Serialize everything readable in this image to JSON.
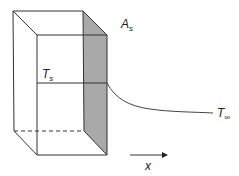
{
  "diagram": {
    "type": "heat-transfer-fin-schematic",
    "colors": {
      "line": "#333333",
      "shaded_face": "#a9a9a9",
      "background": "#ffffff"
    },
    "labels": {
      "surface_area": {
        "main": "A",
        "sub": "s"
      },
      "surface_temperature": {
        "main": "T",
        "sub": "s"
      },
      "ambient_temperature": {
        "main": "T",
        "sub": "∞"
      },
      "axis": {
        "main": "x"
      }
    },
    "elements": [
      "rectangular solid (wall/block) drawn in oblique projection",
      "shaded right face (surface area A_s)",
      "horizontal line at temperature T_s across front face",
      "temperature profile curve decaying from T_s to T_∞",
      "x-direction arrow"
    ]
  }
}
